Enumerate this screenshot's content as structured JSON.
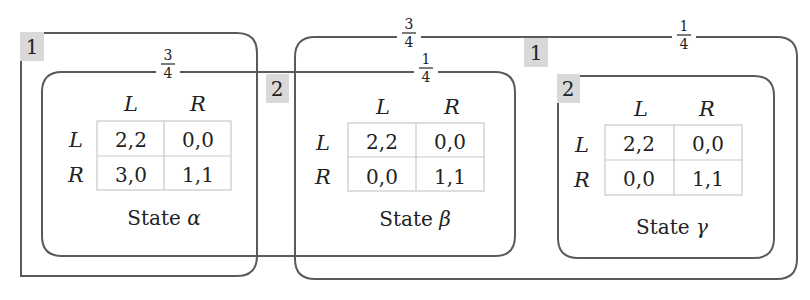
{
  "figure": {
    "outer_info_sets": [
      {
        "player_label": "1",
        "fraction_left": {
          "num": "3",
          "den": "4"
        },
        "fraction_right": {
          "num": "1",
          "den": "4"
        }
      },
      {
        "player_label": "1",
        "fraction_left": {
          "num": "3",
          "den": "4"
        },
        "fraction_right": {
          "num": "1",
          "den": "4"
        }
      }
    ],
    "info_sets": {
      "player1_left": {
        "label": "1"
      },
      "player2_left": {
        "label": "2",
        "fraction_alpha": {
          "num": "3",
          "den": "4"
        },
        "fraction_beta": {
          "num": "1",
          "den": "4"
        }
      },
      "player1_right": {
        "label": "1",
        "fraction_beta": {
          "num": "3",
          "den": "4"
        },
        "fraction_gamma": {
          "num": "1",
          "den": "4"
        }
      },
      "player2_right": {
        "label": "2"
      }
    },
    "states": [
      {
        "name": "State",
        "symbol": "α",
        "col_headers": [
          "L",
          "R"
        ],
        "row_headers": [
          "L",
          "R"
        ],
        "payoffs": [
          [
            "2,2",
            "0,0"
          ],
          [
            "3,0",
            "1,1"
          ]
        ]
      },
      {
        "name": "State",
        "symbol": "β",
        "col_headers": [
          "L",
          "R"
        ],
        "row_headers": [
          "L",
          "R"
        ],
        "payoffs": [
          [
            "2,2",
            "0,0"
          ],
          [
            "0,0",
            "1,1"
          ]
        ]
      },
      {
        "name": "State",
        "symbol": "γ",
        "col_headers": [
          "L",
          "R"
        ],
        "row_headers": [
          "L",
          "R"
        ],
        "payoffs": [
          [
            "2,2",
            "0,0"
          ],
          [
            "0,0",
            "1,1"
          ]
        ]
      }
    ],
    "colors": {
      "box_stroke": "#5a5a5a",
      "label_bg": "#d9d9d9",
      "grid": "#c8c8c8",
      "text": "#222222"
    }
  }
}
